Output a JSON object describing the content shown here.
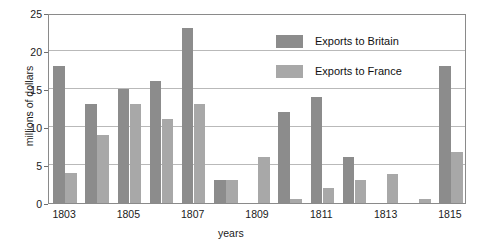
{
  "chart_data": {
    "type": "bar",
    "title": "",
    "xlabel": "years",
    "ylabel": "millions of dollars",
    "ylim": [
      0,
      25
    ],
    "yticks": [
      0,
      5,
      10,
      15,
      20,
      25
    ],
    "grid": true,
    "legend_position": "top-right",
    "categories": [
      "1803",
      "1804",
      "1805",
      "1806",
      "1807",
      "1808",
      "1809",
      "1810",
      "1811",
      "1812",
      "1813",
      "1814",
      "1815"
    ],
    "tick_labels": [
      "1803",
      "",
      "1805",
      "",
      "1807",
      "",
      "1809",
      "",
      "1811",
      "",
      "1813",
      "",
      "1815"
    ],
    "series": [
      {
        "name": "Exports to Britain",
        "color": "#8c8c8c",
        "values": [
          18,
          13,
          15,
          16,
          23,
          3,
          0,
          12,
          14,
          6,
          0,
          0,
          18
        ]
      },
      {
        "name": "Exports to France",
        "color": "#a8a8a8",
        "values": [
          4,
          9,
          13,
          11,
          13,
          3,
          6,
          0.5,
          2,
          3,
          3.8,
          0.5,
          6.7
        ]
      }
    ]
  },
  "legend": {
    "items": [
      {
        "label": "Exports to Britain",
        "color": "#8c8c8c"
      },
      {
        "label": "Exports to France",
        "color": "#a8a8a8"
      }
    ]
  },
  "axes": {
    "y_title": "millions of dollars",
    "x_title": "years"
  },
  "colors": {
    "britain": "#8c8c8c",
    "france": "#a8a8a8",
    "grid": "#b9b9b9",
    "frame": "#8a8a8a",
    "text": "#1a1a1a",
    "background": "#ffffff"
  }
}
